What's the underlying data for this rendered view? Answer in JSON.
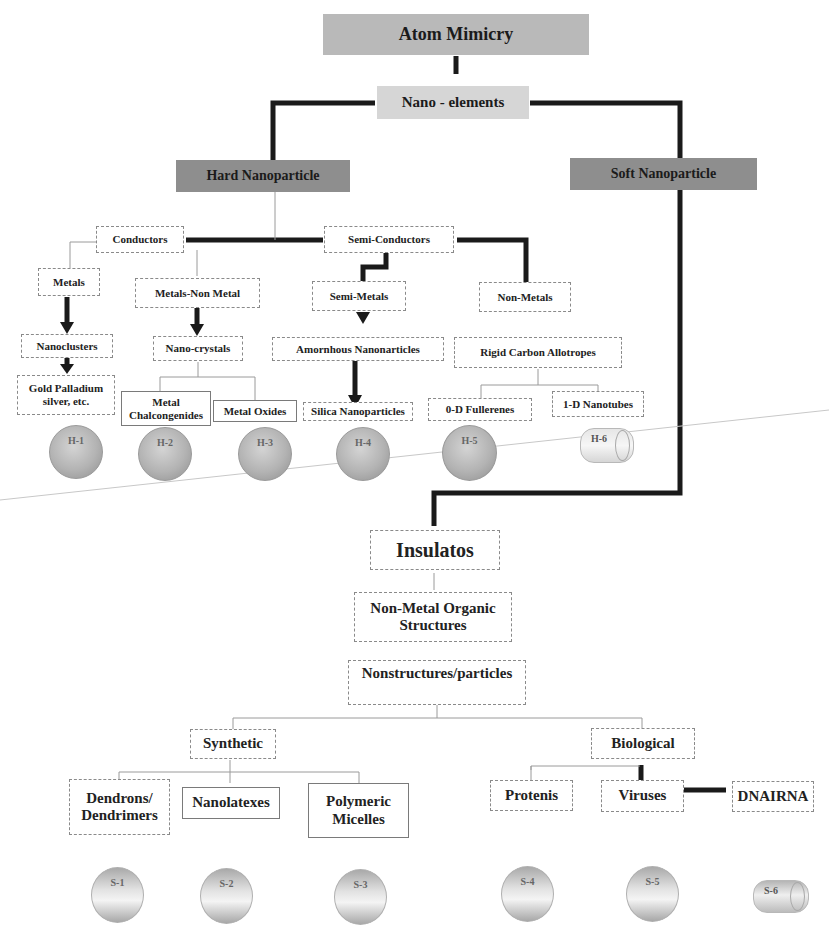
{
  "diagram": {
    "root": "Atom Mimicry",
    "level1": "Nano - elements",
    "branches": {
      "hard": "Hard Nanoparticle",
      "soft": "Soft Nanoparticle"
    },
    "hard_tree": {
      "conductors": "Conductors",
      "semi_conductors": "Semi-Conductors",
      "metals": "Metals",
      "metals_non_metal": "Metals-Non Metal",
      "semi_metals": "Semi-Metals",
      "non_metals": "Non-Metals",
      "nanoclusters": "Nanoclusters",
      "nano_crystals": "Nano-crystals",
      "amorphous_nanoparticles": "Amornhous Nanonarticles",
      "rigid_carbon_allotropes": "Rigid Carbon Allotropes",
      "gold_palladium": "Gold Palladium silver, etc.",
      "metal_chalcogenides": "Metal Chalcongenides",
      "metal_oxides": "Metal Oxides",
      "silica_nanoparticles": "Silica Nanoparticles",
      "fullerenes": "0-D Fullerenes",
      "nanotubes": "1-D Nanotubes"
    },
    "hard_particles": [
      "H-1",
      "H-2",
      "H-3",
      "H-4",
      "H-5",
      "H-6"
    ],
    "soft_tree": {
      "insulators": "Insulatos",
      "non_metal_organic": "Non-Metal Organic Structures",
      "nonstructures": "Nonstructures/particles",
      "synthetic": "Synthetic",
      "biological": "Biological",
      "dendrons": "Dendrons/ Dendrimers",
      "nanolatexes": "Nanolatexes",
      "polymeric_micelles": "Polymeric Micelles",
      "proteins": "Protenis",
      "viruses": "Viruses",
      "dna_rna": "DNAIRNA"
    },
    "soft_particles": [
      "S-1",
      "S-2",
      "S-3",
      "S-4",
      "S-5",
      "S-6"
    ]
  }
}
